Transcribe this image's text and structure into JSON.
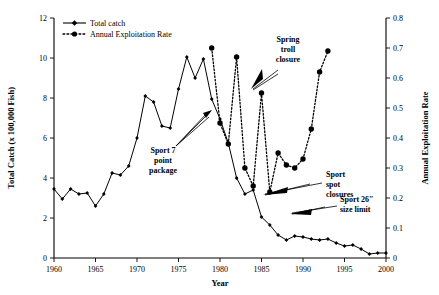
{
  "chart_data": {
    "type": "line",
    "title": "",
    "xlabel": "Year",
    "ylabel": "Total Catch (x 100,000 Fish)",
    "y2label": "Annual Exploitation Rate",
    "xlim": [
      1960,
      2000
    ],
    "ylim": [
      0,
      12
    ],
    "y2lim": [
      0,
      0.8
    ],
    "xticks": [
      1960,
      1965,
      1970,
      1975,
      1980,
      1985,
      1990,
      1995,
      2000
    ],
    "yticks": [
      0,
      2,
      4,
      6,
      8,
      10,
      12
    ],
    "y2ticks": [
      0,
      0.1,
      0.2,
      0.3,
      0.4,
      0.5,
      0.6,
      0.7,
      0.8
    ],
    "xtick_labels": [
      "1960",
      "1965",
      "1970",
      "1975",
      "1980",
      "1985",
      "1990",
      "1995",
      "2000"
    ],
    "ytick_labels": [
      "0",
      "2",
      "4",
      "6",
      "8",
      "10",
      "12"
    ],
    "y2tick_labels": [
      "0",
      "0.1",
      "0.2",
      "0.3",
      "0.4",
      "0.5",
      "0.6",
      "0.7",
      "0.8"
    ],
    "grid": false,
    "legend_position": "top-left",
    "series": [
      {
        "name": "Total catch",
        "axis": "left",
        "style": "solid-line-with-markers",
        "x": [
          1960,
          1961,
          1962,
          1963,
          1964,
          1965,
          1966,
          1967,
          1968,
          1969,
          1970,
          1971,
          1972,
          1973,
          1974,
          1975,
          1976,
          1977,
          1978,
          1979,
          1980,
          1981,
          1982,
          1983,
          1984,
          1985,
          1986,
          1987,
          1988,
          1989,
          1990,
          1991,
          1992,
          1993,
          1994,
          1995,
          1996,
          1997,
          1998,
          1999,
          2000
        ],
        "values": [
          3.45,
          2.95,
          3.45,
          3.2,
          3.25,
          2.6,
          3.2,
          4.25,
          4.15,
          4.6,
          6.0,
          8.1,
          7.8,
          6.6,
          6.5,
          8.45,
          10.05,
          9.0,
          9.95,
          7.95,
          6.95,
          5.75,
          4.0,
          3.2,
          3.4,
          2.05,
          1.65,
          1.15,
          0.9,
          1.1,
          1.05,
          0.95,
          0.9,
          0.95,
          0.75,
          0.6,
          0.65,
          0.45,
          0.2,
          0.25,
          0.25
        ]
      },
      {
        "name": "Annual Exploitation Rate",
        "axis": "right",
        "style": "dotted-line-with-markers",
        "x": [
          1979,
          1980,
          1981,
          1982,
          1983,
          1984,
          1985,
          1986,
          1987,
          1988,
          1989,
          1990,
          1991,
          1992,
          1993
        ],
        "values": [
          0.7,
          0.45,
          0.38,
          0.67,
          0.3,
          0.24,
          0.55,
          0.22,
          0.35,
          0.31,
          0.3,
          0.33,
          0.43,
          0.62,
          0.69
        ]
      }
    ],
    "annotations": [
      {
        "id": "sport-7-point-package",
        "text": "Sport 7 point package",
        "lines": [
          "Sport 7",
          "point",
          "package"
        ]
      },
      {
        "id": "spring-troll-closure",
        "text": "Spring troll closure",
        "lines": [
          "Spring",
          "troll",
          "closure"
        ]
      },
      {
        "id": "sport-spot-closures",
        "text": "Sport spot closures",
        "lines": [
          "Sport",
          "spot",
          "closures"
        ]
      },
      {
        "id": "sport-26-size-limit",
        "text": "Sport 26\" size limit",
        "lines": [
          "Sport 26\"",
          "size limit"
        ]
      }
    ]
  },
  "legend": {
    "items": [
      {
        "label": "Total catch"
      },
      {
        "label": "Annual Exploitation Rate"
      }
    ]
  },
  "colors": {
    "line": "#000000",
    "background": "#ffffff",
    "text": "#000000"
  }
}
